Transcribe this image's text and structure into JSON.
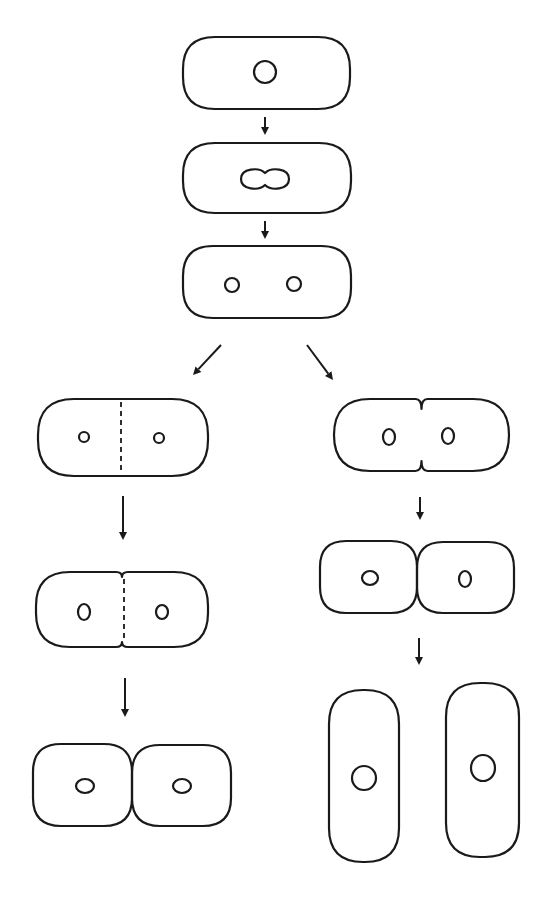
{
  "diagram": {
    "title": "",
    "colors": {
      "background": "#ffffff",
      "stroke": "#1a1a1a"
    },
    "stages": [
      {
        "id": "cell-1",
        "label": "",
        "shape": "rod",
        "x": 183,
        "y": 37,
        "w": 167,
        "h": 72,
        "r": 32,
        "nuclei": [
          {
            "cx": 265,
            "cy": 72,
            "rx": 11,
            "ry": 11
          }
        ]
      },
      {
        "id": "cell-2",
        "label": "",
        "shape": "rod",
        "x": 183,
        "y": 143,
        "w": 168,
        "h": 70,
        "r": 32,
        "nuclei": [],
        "dividing_nucleus": {
          "cx": 265,
          "cy": 179,
          "w": 48,
          "h": 22
        }
      },
      {
        "id": "cell-3",
        "label": "",
        "shape": "rod",
        "x": 183,
        "y": 246,
        "w": 168,
        "h": 72,
        "r": 30,
        "nuclei": [
          {
            "cx": 232,
            "cy": 285,
            "rx": 7,
            "ry": 7
          },
          {
            "cx": 294,
            "cy": 284,
            "rx": 7,
            "ry": 7
          }
        ]
      },
      {
        "id": "left-1",
        "label": "",
        "shape": "rod-septum",
        "x": 38,
        "y": 399,
        "w": 170,
        "h": 77,
        "r": 36,
        "septum_x": 121,
        "nuclei": [
          {
            "cx": 84,
            "cy": 437,
            "rx": 5,
            "ry": 5
          },
          {
            "cx": 159,
            "cy": 438,
            "rx": 5,
            "ry": 5
          }
        ]
      },
      {
        "id": "left-2",
        "label": "",
        "shape": "pinched",
        "x": 36,
        "y": 572,
        "w": 172,
        "h": 75,
        "r": 34,
        "pinch": 5,
        "septum_x": 124,
        "nuclei": [
          {
            "cx": 84,
            "cy": 612,
            "rx": 6,
            "ry": 8
          },
          {
            "cx": 162,
            "cy": 612,
            "rx": 6,
            "ry": 7
          }
        ]
      },
      {
        "id": "left-3",
        "label": "",
        "shape": "pair",
        "x": 33,
        "y": 744,
        "w": 198,
        "h": 82,
        "r": 28,
        "nuclei": [
          {
            "cx": 85,
            "cy": 786,
            "rx": 9,
            "ry": 7
          },
          {
            "cx": 182,
            "cy": 786,
            "rx": 9,
            "ry": 7
          }
        ]
      },
      {
        "id": "right-1",
        "label": "",
        "shape": "pinched-deep",
        "x": 334,
        "y": 399,
        "w": 175,
        "h": 72,
        "r": 36,
        "pinch": 10,
        "nuclei": [
          {
            "cx": 389,
            "cy": 437,
            "rx": 6,
            "ry": 8
          },
          {
            "cx": 448,
            "cy": 436,
            "rx": 6,
            "ry": 8
          }
        ]
      },
      {
        "id": "right-2",
        "label": "",
        "shape": "pair",
        "x": 320,
        "y": 541,
        "w": 194,
        "h": 72,
        "r": 26,
        "nuclei": [
          {
            "cx": 370,
            "cy": 578,
            "rx": 8,
            "ry": 7
          },
          {
            "cx": 465,
            "cy": 579,
            "rx": 6,
            "ry": 8
          }
        ]
      },
      {
        "id": "right-3a",
        "label": "",
        "shape": "rod-vertical",
        "x": 329,
        "y": 690,
        "w": 70,
        "h": 172,
        "r": 34,
        "nuclei": [
          {
            "cx": 364,
            "cy": 778,
            "rx": 12,
            "ry": 12
          }
        ]
      },
      {
        "id": "right-3b",
        "label": "",
        "shape": "rod-vertical",
        "x": 446,
        "y": 683,
        "w": 73,
        "h": 174,
        "r": 34,
        "nuclei": [
          {
            "cx": 483,
            "cy": 768,
            "rx": 12,
            "ry": 13
          }
        ]
      }
    ],
    "arrows": [
      {
        "id": "arrow-1-2",
        "x1": 265,
        "y1": 117,
        "x2": 265,
        "y2": 135
      },
      {
        "id": "arrow-2-3",
        "x1": 265,
        "y1": 221,
        "x2": 265,
        "y2": 239
      },
      {
        "id": "arrow-branch-left",
        "x1": 221,
        "y1": 345,
        "x2": 193,
        "y2": 375
      },
      {
        "id": "arrow-branch-right",
        "x1": 307,
        "y1": 345,
        "x2": 333,
        "y2": 380
      },
      {
        "id": "arrow-left-1-2",
        "x1": 123,
        "y1": 496,
        "x2": 123,
        "y2": 540
      },
      {
        "id": "arrow-left-2-3",
        "x1": 125,
        "y1": 678,
        "x2": 125,
        "y2": 717
      },
      {
        "id": "arrow-right-1-2",
        "x1": 420,
        "y1": 497,
        "x2": 420,
        "y2": 520
      },
      {
        "id": "arrow-right-2-3",
        "x1": 419,
        "y1": 638,
        "x2": 419,
        "y2": 665
      }
    ]
  }
}
